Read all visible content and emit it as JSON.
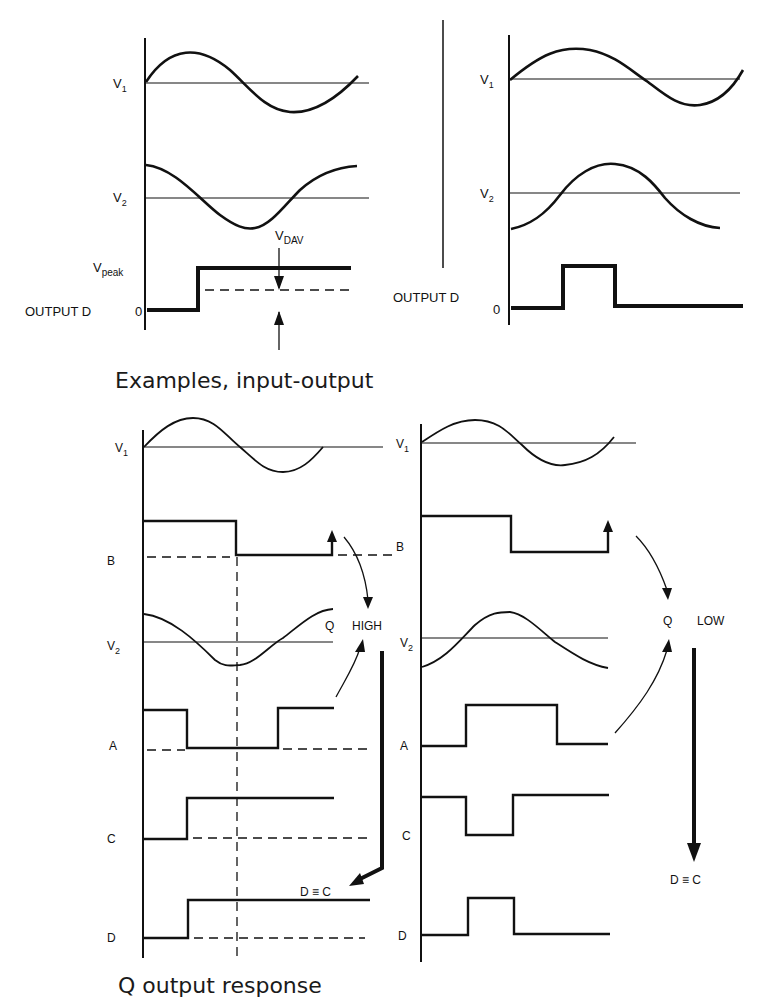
{
  "figure": {
    "top_section": {
      "caption": "Examples, input-output",
      "left_panel": {
        "labels": {
          "v1": "V",
          "v1_sub": "1",
          "v2": "V",
          "v2_sub": "2",
          "vpeak": "V",
          "vpeak_sub": "peak",
          "vdav": "V",
          "vdav_sub": "DAV",
          "output": "OUTPUT  D",
          "zero": "0"
        },
        "description": "V1 sine starting at zero, V2 cosine starting at peak; output D steps from 0 to Vpeak and stays high; VDAV average level shown dashed"
      },
      "right_panel": {
        "labels": {
          "v1": "V",
          "v1_sub": "1",
          "v2": "V",
          "v2_sub": "2",
          "output": "OUTPUT  D",
          "zero": "0"
        },
        "description": "V1 sine; V2 inverted cosine starting at trough; output D is a single pulse"
      }
    },
    "bottom_section": {
      "caption": "Q output response",
      "left_panel": {
        "signals": [
          "V1",
          "B",
          "V2",
          "A",
          "C",
          "D"
        ],
        "labels": {
          "v1": "V",
          "v1_sub": "1",
          "b": "B",
          "v2": "V",
          "v2_sub": "2",
          "a": "A",
          "c": "C",
          "d": "D"
        },
        "q_label": "Q",
        "state": "HIGH",
        "result": "D ≡ C",
        "description": "B falls mid-cycle; A low pulse; C and D step high and stay high"
      },
      "right_panel": {
        "signals": [
          "V1",
          "B",
          "V2",
          "A",
          "C",
          "D"
        ],
        "labels": {
          "v1": "V",
          "v1_sub": "1",
          "b": "B",
          "v2": "V",
          "v2_sub": "2",
          "a": "A",
          "c": "C",
          "d": "D"
        },
        "q_label": "Q",
        "state": "LOW",
        "result": "D ≡ C",
        "description": "B falls mid-cycle; A high pulse; C low notch; D single short pulse"
      }
    },
    "colors": {
      "ink": "#111111",
      "background": "#ffffff"
    }
  }
}
